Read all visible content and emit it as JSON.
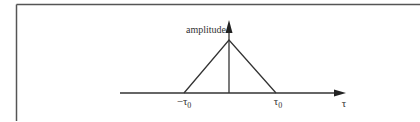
{
  "diagram": {
    "type": "triangular-pulse",
    "vertical_axis_label": "amplitude",
    "horizontal_axis_label": "τ",
    "tick_labels": {
      "left": "−τ",
      "left_subscript": "0",
      "right": "τ",
      "right_subscript": "0"
    },
    "colors": {
      "stroke": "#333333",
      "frame": "#555555",
      "background": "#ffffff"
    },
    "shape": {
      "peak_at": 0,
      "base_left": "-τ0",
      "base_right": "τ0",
      "center_line": true
    }
  }
}
